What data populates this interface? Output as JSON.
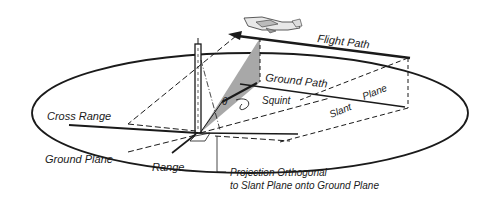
{
  "diagram": {
    "type": "SAR imaging geometry",
    "labels": {
      "flight_path": "Flight Path",
      "ground_path": "Ground Path",
      "squint": "Squint",
      "slant": "Slant",
      "plane": "Plane",
      "theta": "θ",
      "cross_range": "Cross Range",
      "ground_plane": "Ground Plane",
      "range": "Range",
      "projection_line1": "Projection Orthogonal",
      "projection_line2": "to Slant Plane onto Ground Plane"
    },
    "colors": {
      "line": "#1a1a1a",
      "shaded_beam": "#a8a8a8",
      "background": "#ffffff"
    }
  }
}
